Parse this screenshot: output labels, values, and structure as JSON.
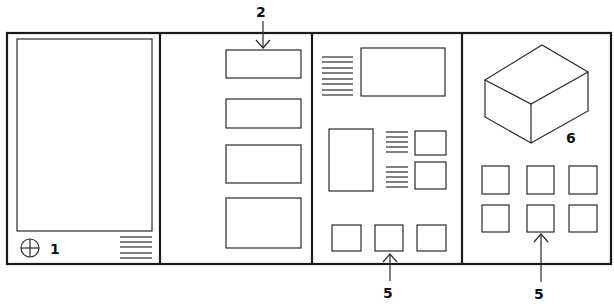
{
  "diagram": {
    "panels": [
      {
        "id": 1,
        "name": "full-screen-panel",
        "label": "1",
        "elements": [
          "large-screen",
          "crosshair-icon",
          "text-lines"
        ]
      },
      {
        "id": 2,
        "name": "stacked-boxes-panel",
        "callout": "2",
        "box_count": 4
      },
      {
        "id": 3,
        "name": "mixed-layout-panel",
        "elements": [
          "text-block",
          "image-box",
          "tall-box",
          "text-lines",
          "small-boxes",
          "bottom-row-boxes"
        ]
      },
      {
        "id": 4,
        "name": "cube-panel",
        "label": "6",
        "grid_boxes": 6
      }
    ],
    "labels": {
      "panel1_number": "1",
      "callout_top": "2",
      "callout_panel3_bottom": "5",
      "callout_panel4_bottom": "5",
      "cube_number": "6"
    },
    "colors": {
      "stroke": "#1a1a1a",
      "background": "#ffffff"
    }
  }
}
